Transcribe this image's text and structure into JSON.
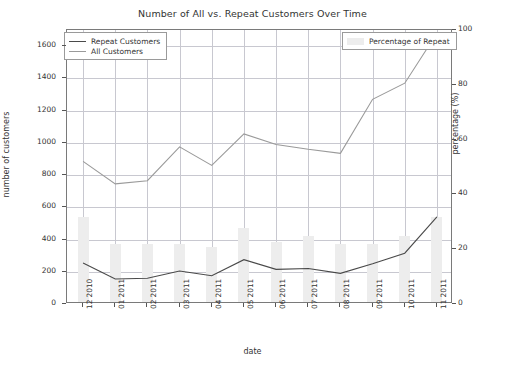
{
  "chart_data": {
    "type": "line",
    "title": "Number of All vs. Repeat Customers Over Time",
    "xlabel": "date",
    "ylabel": "number of customers",
    "y2label": "percentage (%)",
    "categories": [
      "12 2010",
      "01 2011",
      "02 2011",
      "03 2011",
      "04 2011",
      "05 2011",
      "06 2011",
      "07 2011",
      "08 2011",
      "09 2011",
      "10 2011",
      "11 2011"
    ],
    "ylim": [
      0,
      1700
    ],
    "y2lim": [
      0,
      100
    ],
    "yticks": [
      0,
      200,
      400,
      600,
      800,
      1000,
      1200,
      1400,
      1600
    ],
    "y2ticks": [
      0,
      20,
      40,
      60,
      80,
      100
    ],
    "grid": true,
    "legend_position": "upper-left and upper-right",
    "series": [
      {
        "name": "Repeat Customers",
        "type": "line",
        "axis": "left",
        "color": "#4a4a4a",
        "values": [
          255,
          155,
          160,
          205,
          175,
          275,
          215,
          220,
          190,
          250,
          315,
          540
        ]
      },
      {
        "name": "All Customers",
        "type": "line",
        "axis": "left",
        "color": "#9a9a9a",
        "values": [
          885,
          745,
          765,
          975,
          860,
          1055,
          990,
          960,
          935,
          1270,
          1370,
          1680
        ]
      },
      {
        "name": "Percentage of Repeat",
        "type": "bar",
        "axis": "right",
        "color": "#ededed",
        "values": [
          31,
          21,
          21,
          21,
          20,
          27,
          22,
          24,
          21,
          21,
          24,
          31
        ]
      }
    ]
  },
  "legend": {
    "lines": [
      {
        "label": "Repeat Customers"
      },
      {
        "label": "All Customers"
      }
    ],
    "bars": [
      {
        "label": "Percentage of Repeat"
      }
    ]
  }
}
